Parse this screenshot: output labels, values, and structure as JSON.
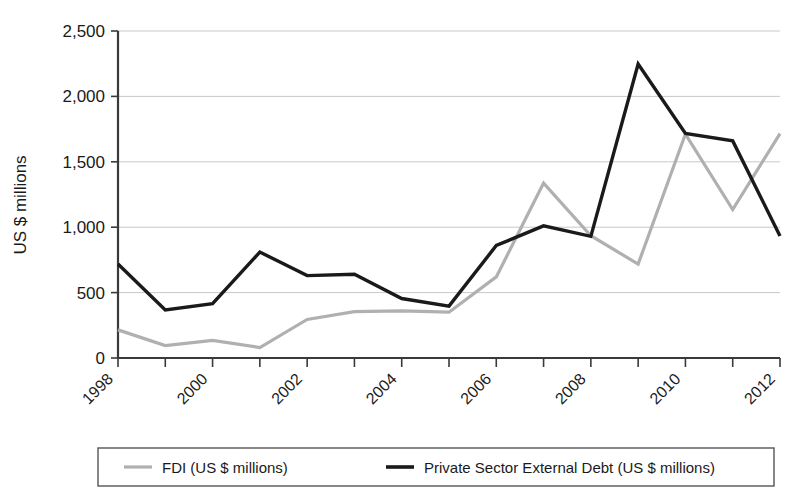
{
  "chart_data": {
    "type": "line",
    "title": "",
    "xlabel": "",
    "ylabel": "US $ millions",
    "x": [
      1998,
      1999,
      2000,
      2001,
      2002,
      2003,
      2004,
      2005,
      2006,
      2007,
      2008,
      2009,
      2010,
      2011,
      2012
    ],
    "xtick_labels": [
      "1998",
      "",
      "2000",
      "",
      "2002",
      "",
      "2004",
      "",
      "2006",
      "",
      "2008",
      "",
      "2010",
      "",
      "2012"
    ],
    "xlim": [
      1998,
      2012
    ],
    "ylim": [
      0,
      2500
    ],
    "ytick_labels": [
      "0",
      "500",
      "1,000",
      "1,500",
      "2,000",
      "2,500"
    ],
    "ytick_values": [
      0,
      500,
      1000,
      1500,
      2000,
      2500
    ],
    "grid": "horizontal",
    "legend_position": "bottom",
    "series": [
      {
        "name": "FDI (US $ millions)",
        "color": "#b0b0b0",
        "values": [
          215,
          95,
          135,
          80,
          295,
          355,
          360,
          350,
          620,
          1337,
          935,
          718,
          1712,
          1135,
          1715
        ]
      },
      {
        "name": "Private Sector External Debt (US $ millions)",
        "color": "#1a1a1a",
        "values": [
          718,
          367,
          415,
          810,
          630,
          640,
          455,
          397,
          860,
          1010,
          930,
          2248,
          1716,
          1660,
          933
        ]
      }
    ]
  },
  "legend": {
    "items": [
      {
        "label": "FDI (US $ millions)",
        "color": "#b0b0b0"
      },
      {
        "label": "Private Sector External Debt (US $ millions)",
        "color": "#1a1a1a"
      }
    ]
  },
  "axes": {
    "y_axis_title": "US $ millions"
  }
}
